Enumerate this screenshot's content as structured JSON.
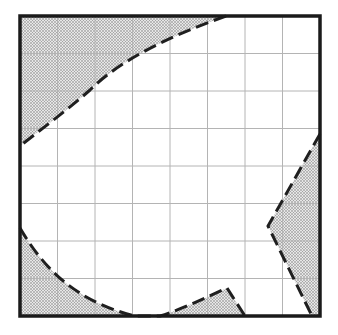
{
  "diagram": {
    "type": "grid-with-shaded-regions",
    "grid": {
      "rows": 8,
      "cols": 8
    },
    "frame": {
      "x": 20,
      "y": 16,
      "width": 300,
      "height": 300
    },
    "colors": {
      "background": "#ffffff",
      "gridline": "#b4b4b4",
      "frame": "#1a1a1a",
      "dash": "#1f1f1f",
      "stipple": "#7a7a7a"
    },
    "regions": [
      {
        "name": "top-left-shaded-region",
        "path": "M20,16 L226,16 C170,36 120,60 90,90 C65,112 40,130 20,146 Z"
      },
      {
        "name": "right-shaded-region",
        "path": "M320,134 L268,226 L312,316 L320,316 Z"
      },
      {
        "name": "bottom-left-shaded-region",
        "path": "M20,228 C40,262 70,300 135,316 L20,316 Z"
      },
      {
        "name": "bottom-center-shaded-region",
        "path": "M160,316 C185,308 205,298 227,288 L245,316 Z"
      }
    ],
    "boundaries": [
      {
        "name": "top-left-boundary",
        "path": "M226,16 C170,36 120,60 90,90 C65,112 40,130 20,146"
      },
      {
        "name": "right-boundary",
        "path": "M320,134 L268,226 L312,316"
      },
      {
        "name": "bottom-left-boundary",
        "path": "M20,228 C40,262 70,300 135,316 L160,316 C185,308 205,298 227,288 L245,316"
      }
    ]
  }
}
